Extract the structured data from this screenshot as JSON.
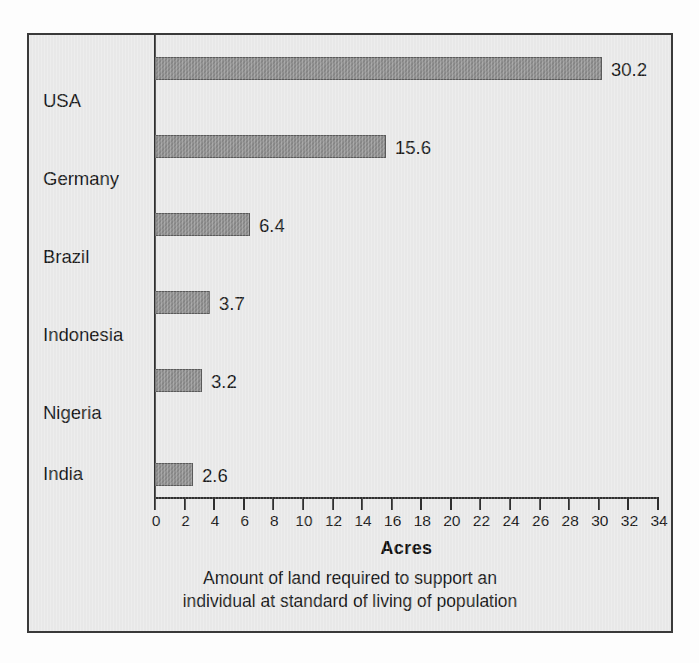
{
  "chart_data": {
    "type": "bar",
    "orientation": "horizontal",
    "title": "",
    "categories": [
      "USA",
      "Germany",
      "Brazil",
      "Indonesia",
      "Nigeria",
      "India"
    ],
    "values": [
      30.2,
      15.6,
      6.4,
      3.7,
      3.2,
      2.6
    ],
    "value_labels": [
      "30.2",
      "15.6",
      "6.4",
      "3.7",
      "3.2",
      "2.6"
    ],
    "xlabel": "Acres",
    "ylabel": "",
    "xlim": [
      0,
      34
    ],
    "xticks": [
      0,
      2,
      4,
      6,
      8,
      10,
      12,
      14,
      16,
      18,
      20,
      22,
      24,
      26,
      28,
      30,
      32,
      34
    ],
    "xtick_labels": [
      "0",
      "2",
      "4",
      "6",
      "8",
      "10",
      "12",
      "14",
      "16",
      "18",
      "20",
      "22",
      "24",
      "26",
      "28",
      "30",
      "32",
      "34"
    ],
    "grid": false,
    "legend": false,
    "legend_position": "none",
    "caption_line_1": "Amount of land required to support an",
    "caption_line_2": "individual at standard of living of population",
    "colors": {
      "bar_fill": "#8d8d8d",
      "bar_stroke": "#5a5a5a",
      "plot_background": "#e9e9e9",
      "frame_border": "#3a3a3a",
      "axis": "#2f2f2f",
      "text": "#1b1b1b"
    }
  }
}
